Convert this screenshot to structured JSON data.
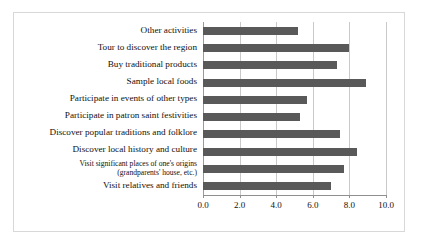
{
  "chart_data": {
    "type": "bar",
    "orientation": "horizontal",
    "title": "",
    "subtitle": "",
    "xlabel": "",
    "ylabel": "",
    "xlim": [
      0.0,
      10.0
    ],
    "xticks": [
      "0.0",
      "2.0",
      "4.0",
      "6.0",
      "8.0",
      "10.0"
    ],
    "xtick_values": [
      0.0,
      2.0,
      4.0,
      6.0,
      8.0,
      10.0
    ],
    "grid": "vertical",
    "legend": "none",
    "bar_color": "#595959",
    "gridline_color": "#c9c9c9",
    "border_color": "#d8d8d8",
    "categories": [
      "Other activities",
      "Tour to discover the region",
      "Buy traditional products",
      "Sample local foods",
      "Participate in events of other types",
      "Participate in patron saint festivities",
      "Discover popular traditions and folklore",
      "Discover local history and culture",
      "Visit significant places of one's origins\n(grandparents' house, etc.)",
      "Visit relatives and friends"
    ],
    "values": [
      5.2,
      8.0,
      7.3,
      8.9,
      5.7,
      5.3,
      7.5,
      8.4,
      7.7,
      7.0
    ],
    "series": [
      {
        "name": "",
        "values": [
          5.2,
          8.0,
          7.3,
          8.9,
          5.7,
          5.3,
          7.5,
          8.4,
          7.7,
          7.0
        ]
      }
    ]
  }
}
